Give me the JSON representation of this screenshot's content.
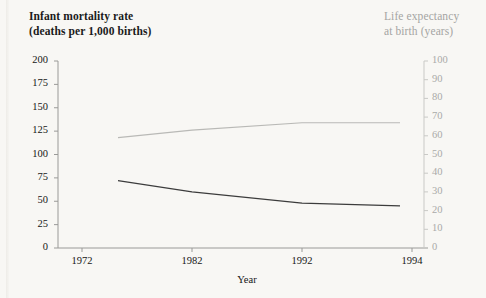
{
  "figure": {
    "left_title_line1": "Infant mortality rate",
    "left_title_line2": "(deaths per 1,000 births)",
    "right_title_line1": "Life expectancy",
    "right_title_line2": "at birth (years)",
    "xlabel": "Year",
    "colors": {
      "background": "#f8f7f4",
      "left_axis": "#9a9a98",
      "right_axis": "#c9c9c6",
      "mortality_line": "#3c3c3c",
      "life_expectancy_line": "#b9b9b6",
      "left_text": "#161616",
      "right_text": "#a5a5a3"
    }
  },
  "chart_data": {
    "type": "line",
    "title": "",
    "xlabel": "Year",
    "x": [
      1972,
      1982,
      1992,
      1994
    ],
    "xtick_labels": [
      "1972",
      "1982",
      "1992",
      "1994"
    ],
    "xlim": [
      1970,
      1996
    ],
    "grid": false,
    "legend": "none",
    "axes": [
      {
        "id": "left",
        "label": "Infant mortality rate (deaths per 1,000 births)",
        "ylim": [
          0,
          200
        ],
        "ytick_values": [
          0,
          25,
          50,
          75,
          100,
          125,
          150,
          175,
          200
        ],
        "ytick_labels": [
          "0",
          "25",
          "50",
          "75",
          "100",
          "125",
          "150",
          "175",
          "200"
        ],
        "side": "left"
      },
      {
        "id": "right",
        "label": "Life expectancy at birth (years)",
        "ylim": [
          0,
          100
        ],
        "ytick_values": [
          0,
          10,
          20,
          30,
          40,
          50,
          60,
          70,
          80,
          90,
          100
        ],
        "ytick_labels": [
          "0",
          "10",
          "20",
          "30",
          "40",
          "50",
          "60",
          "70",
          "80",
          "90",
          "100"
        ],
        "side": "right"
      }
    ],
    "series": [
      {
        "name": "Infant mortality rate",
        "axis": "left",
        "color": "#3c3c3c",
        "x": [
          1972,
          1982,
          1992,
          1994
        ],
        "values": [
          72,
          60,
          48,
          45
        ]
      },
      {
        "name": "Life expectancy at birth",
        "axis": "right",
        "color": "#b9b9b6",
        "x": [
          1972,
          1982,
          1992,
          1994
        ],
        "values": [
          59,
          63,
          67,
          67
        ]
      }
    ]
  }
}
